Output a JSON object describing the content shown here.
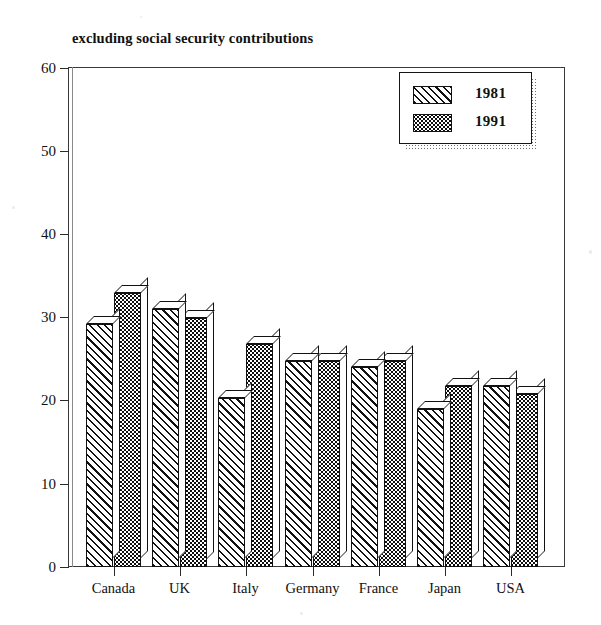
{
  "chart_data": {
    "type": "bar",
    "title": "excluding social security contributions",
    "xlabel": "",
    "ylabel": "",
    "ylim": [
      0,
      60
    ],
    "yticks": [
      0,
      10,
      20,
      30,
      40,
      50,
      60
    ],
    "grid": false,
    "legend_position": "top-right",
    "categories": [
      "Canada",
      "UK",
      "Italy",
      "Germany",
      "France",
      "Japan",
      "USA"
    ],
    "series": [
      {
        "name": "1981",
        "fill": "diagonal-hatch",
        "values": [
          29.2,
          31.0,
          20.3,
          24.8,
          24.0,
          19.0,
          21.8
        ]
      },
      {
        "name": "1991",
        "fill": "dark-dotted",
        "values": [
          33.0,
          30.0,
          26.8,
          24.8,
          24.8,
          21.8,
          20.8
        ]
      }
    ]
  },
  "axis": {
    "y_tick_labels": [
      "60",
      "50",
      "40",
      "30",
      "20",
      "10",
      "0"
    ],
    "x_tick_labels": [
      "Canada",
      "UK",
      "Italy",
      "Germany",
      "France",
      "Japan",
      "USA"
    ]
  },
  "legend": {
    "entries": [
      {
        "label": "1981"
      },
      {
        "label": "1991"
      }
    ]
  },
  "colors": {
    "axis": "#2b2b2b",
    "frame": "#3a3a3a",
    "bar_1981_fill": "#ffffff",
    "bar_1981_stroke": "#111111",
    "bar_1991_fill": "#0d0d0d",
    "bar_1991_stroke": "#111111",
    "text": "#111111",
    "background": "#ffffff"
  }
}
